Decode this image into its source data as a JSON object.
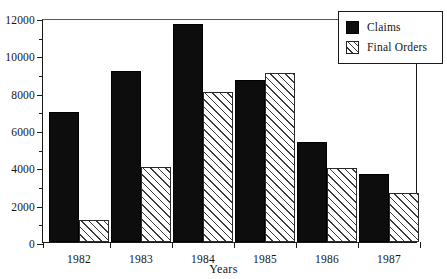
{
  "chart_data": {
    "type": "bar",
    "title": "",
    "xlabel": "Years",
    "ylabel": "",
    "categories": [
      "1982",
      "1983",
      "1984",
      "1985",
      "1986",
      "1987"
    ],
    "series": [
      {
        "name": "Claims",
        "values": [
          6950,
          9150,
          11700,
          8700,
          5350,
          3650
        ]
      },
      {
        "name": "Final Orders",
        "values": [
          1200,
          4000,
          8050,
          9050,
          3950,
          2650
        ]
      }
    ],
    "ylim": [
      0,
      12000
    ],
    "ytick_labels": [
      "0",
      "2000",
      "4000",
      "6000",
      "8000",
      "10000",
      "12000"
    ],
    "ytick_values": [
      0,
      2000,
      4000,
      6000,
      8000,
      10000,
      12000
    ],
    "yminor_step": 1000,
    "grid": false,
    "legend_position": "top-right",
    "legend_entries": [
      "Claims",
      "Final Orders"
    ],
    "colors": {
      "claims": "#0d0d0d",
      "final_orders_fill": "#ffffff",
      "final_orders_hatch": "#333333",
      "axis": "#1a1a1a",
      "text": "#151515",
      "background": "#ffffff"
    }
  }
}
